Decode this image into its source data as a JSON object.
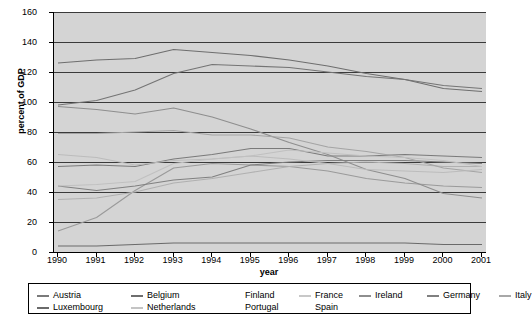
{
  "chart_data": {
    "type": "line",
    "title": "",
    "xlabel": "year",
    "ylabel": "percent of GDP",
    "xlim": [
      1990,
      2001
    ],
    "ylim": [
      0,
      160
    ],
    "ytick_step": 20,
    "grid": true,
    "legend_position": "bottom",
    "x": [
      1990,
      1991,
      1992,
      1993,
      1994,
      1995,
      1996,
      1997,
      1998,
      1999,
      2000,
      2001
    ],
    "categories": [
      "1990",
      "1991",
      "1992",
      "1993",
      "1994",
      "1995",
      "1996",
      "1997",
      "1998",
      "1999",
      "2000",
      "2001"
    ],
    "yticks": [
      0,
      20,
      40,
      60,
      80,
      100,
      120,
      140,
      160
    ],
    "series": [
      {
        "name": "Austria",
        "color": "#7a7a7a",
        "values": [
          57,
          58,
          57,
          62,
          65,
          69,
          69,
          64,
          64,
          65,
          64,
          63
        ]
      },
      {
        "name": "Belgium",
        "color": "#6e6e6e",
        "values": [
          126,
          128,
          129,
          135,
          133,
          131,
          128,
          124,
          119,
          115,
          109,
          107
        ]
      },
      {
        "name": "Finland",
        "color": "#9a9a9a",
        "values": [
          14,
          23,
          41,
          56,
          59,
          58,
          57,
          54,
          49,
          46,
          44,
          43
        ]
      },
      {
        "name": "France",
        "color": "#b0b0b0",
        "values": [
          35,
          36,
          40,
          46,
          49,
          53,
          57,
          59,
          60,
          59,
          57,
          57
        ]
      },
      {
        "name": "Ireland",
        "color": "#8e8e8e",
        "values": [
          97,
          95,
          92,
          96,
          90,
          82,
          73,
          65,
          55,
          49,
          39,
          36
        ]
      },
      {
        "name": "Germany",
        "color": "#808080",
        "values": [
          44,
          41,
          44,
          48,
          50,
          58,
          60,
          61,
          61,
          61,
          60,
          59
        ]
      },
      {
        "name": "Italy",
        "color": "#747474",
        "values": [
          98,
          101,
          108,
          119,
          125,
          124,
          123,
          120,
          117,
          115,
          111,
          109
        ]
      },
      {
        "name": "Luxembourg",
        "color": "#6a6a6a",
        "values": [
          4,
          4,
          5,
          6,
          6,
          6,
          6,
          6,
          6,
          6,
          5,
          5
        ]
      },
      {
        "name": "Netherlands",
        "color": "#a4a4a4",
        "values": [
          79,
          79,
          80,
          81,
          78,
          78,
          76,
          70,
          67,
          63,
          56,
          53
        ]
      },
      {
        "name": "Portugal",
        "color": "#bcbcbc",
        "values": [
          65,
          63,
          58,
          61,
          62,
          64,
          62,
          59,
          55,
          54,
          53,
          55
        ]
      },
      {
        "name": "Spain",
        "color": "#c0c0c0",
        "values": [
          44,
          45,
          47,
          59,
          62,
          64,
          68,
          66,
          64,
          63,
          61,
          57
        ]
      }
    ],
    "legend_rows": [
      [
        {
          "label": "Austria",
          "has_swatch": true,
          "color": "#7a7a7a"
        },
        {
          "label": "Belgium",
          "has_swatch": true,
          "color": "#6e6e6e"
        },
        {
          "label": "Finland",
          "has_swatch": false,
          "color": "#9a9a9a"
        },
        {
          "label": "France",
          "has_swatch": true,
          "color": "#c8c8c8"
        },
        {
          "label": "Ireland",
          "has_swatch": true,
          "color": "#8e8e8e"
        },
        {
          "label": "Germany",
          "has_swatch": true,
          "color": "#808080"
        },
        {
          "label": "Italy",
          "has_swatch": true,
          "color": "#a8a8a8"
        }
      ],
      [
        {
          "label": "Luxembourg",
          "has_swatch": true,
          "color": "#6a6a6a"
        },
        {
          "label": "Netherlands",
          "has_swatch": true,
          "color": "#c4c4c4"
        },
        {
          "label": "Portugal",
          "has_swatch": false,
          "color": "#bcbcbc"
        },
        {
          "label": "Spain",
          "has_swatch": false,
          "color": "#c0c0c0"
        }
      ]
    ]
  },
  "axes": {
    "y_title": "percent of GDP",
    "x_title": "year"
  },
  "colors": {
    "plot_background": "#d4d4d4",
    "gridline": "#3a3a3a",
    "axis": "#000000",
    "page_background": "#ffffff"
  }
}
